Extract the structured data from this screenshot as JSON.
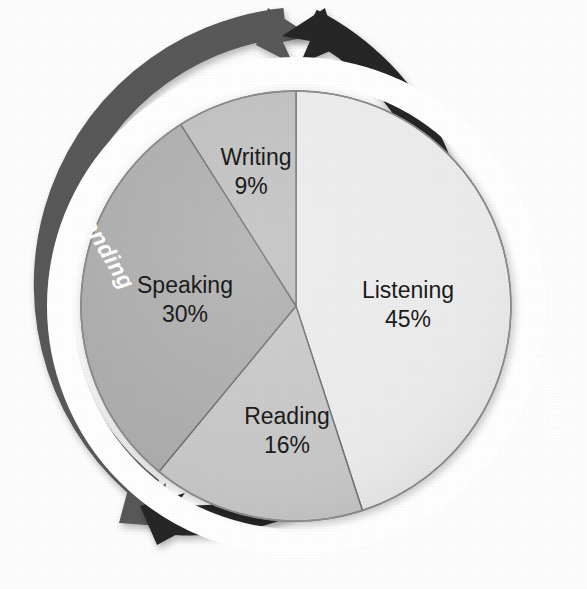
{
  "figure": {
    "background_color": "#fdfdfd"
  },
  "chart_data": {
    "type": "pie",
    "title": "",
    "subtitle": "",
    "xlabel": "",
    "ylabel": "",
    "legend_position": "none",
    "start_angle_deg": 0,
    "direction": "clockwise",
    "categories": [
      "Listening",
      "Reading",
      "Speaking",
      "Writing"
    ],
    "values": [
      45,
      16,
      30,
      9
    ],
    "value_suffix": "%",
    "labels": [
      {
        "name": "Listening",
        "percent": 45,
        "label": "Listening",
        "value_label": "45%",
        "color": "#ebebeb",
        "start_deg": 0,
        "end_deg": 162
      },
      {
        "name": "Reading",
        "percent": 16,
        "label": "Reading",
        "value_label": "16%",
        "color": "#c6c6c6",
        "start_deg": 162,
        "end_deg": 219.6
      },
      {
        "name": "Speaking",
        "percent": 30,
        "label": "Speaking",
        "value_label": "30%",
        "color": "#ababab",
        "start_deg": 219.6,
        "end_deg": 327.6
      },
      {
        "name": "Writing",
        "percent": 9,
        "label": "Writing",
        "value_label": "9%",
        "color": "#bebebe",
        "start_deg": 327.6,
        "end_deg": 360
      }
    ],
    "slice_border_color": "#6e6e6e",
    "annotations": [
      {
        "name": "sending-arc",
        "text": "Sending",
        "color": "#ffffff",
        "band_color": "#585858",
        "side": "left"
      },
      {
        "name": "receiving-arc",
        "text": "Receiving",
        "color": "#ffffff",
        "band_color": "#262626",
        "side": "right"
      }
    ]
  },
  "arcs": {
    "sending": {
      "label": "Sending",
      "band_color": "#585858",
      "text_color": "#ffffff"
    },
    "receiving": {
      "label": "Receiving",
      "band_color": "#262626",
      "text_color": "#ffffff"
    }
  },
  "colors": {
    "listening": "#ebebeb",
    "reading": "#c6c6c6",
    "speaking": "#ababab",
    "writing": "#bebebe",
    "sending_band": "#585858",
    "receiving_band": "#262626",
    "slice_outline": "#6e6e6e",
    "background": "#fdfdfd"
  }
}
